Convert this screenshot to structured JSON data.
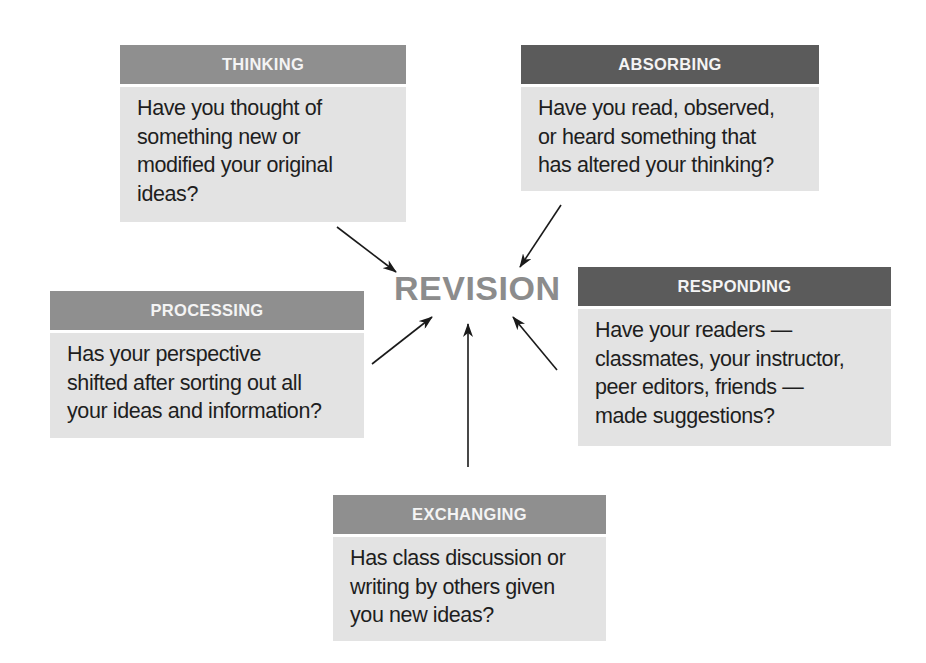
{
  "center": {
    "label": "REVISION",
    "color": "#8c8c8c"
  },
  "nodes": [
    {
      "id": "thinking",
      "title": "THINKING",
      "text": "Have you thought of\nsomething new or\nmodified your original\nideas?",
      "header_color": "#8f8f8f"
    },
    {
      "id": "absorbing",
      "title": "ABSORBING",
      "text": "Have you read, observed,\nor heard something that\nhas altered your thinking?",
      "header_color": "#5b5b5b"
    },
    {
      "id": "processing",
      "title": "PROCESSING",
      "text": "Has your perspective\nshifted after sorting out all\nyour ideas and information?",
      "header_color": "#8f8f8f"
    },
    {
      "id": "responding",
      "title": "RESPONDING",
      "text": "Have your readers —\nclassmates, your instructor,\npeer editors, friends —\nmade suggestions?",
      "header_color": "#5b5b5b"
    },
    {
      "id": "exchanging",
      "title": "EXCHANGING",
      "text": "Has class discussion or\nwriting by others given\nyou new ideas?",
      "header_color": "#8f8f8f"
    }
  ],
  "edges": [
    {
      "from": "thinking",
      "to": "revision"
    },
    {
      "from": "absorbing",
      "to": "revision"
    },
    {
      "from": "processing",
      "to": "revision"
    },
    {
      "from": "exchanging",
      "to": "revision"
    },
    {
      "from": "responding",
      "to": "revision"
    }
  ],
  "colors": {
    "box_body": "#e3e3e3",
    "header_light": "#8f8f8f",
    "header_dark": "#5b5b5b",
    "arrow": "#1a1a1a"
  }
}
